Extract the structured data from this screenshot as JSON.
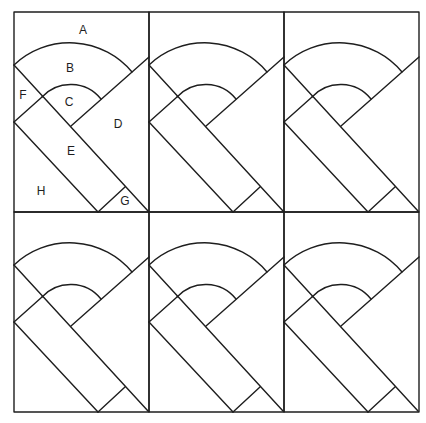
{
  "figure": {
    "type": "quilt-block-diagram",
    "grid": {
      "rows": 2,
      "cols": 3
    },
    "stroke_color": "#1e1e1e",
    "background": "#ffffff"
  },
  "labels": {
    "A": "A",
    "B": "B",
    "C": "C",
    "D": "D",
    "E": "E",
    "F": "F",
    "G": "G",
    "H": "H"
  },
  "piece_labels": [
    {
      "key": "A",
      "x": 83,
      "y": 30
    },
    {
      "key": "B",
      "x": 70,
      "y": 68
    },
    {
      "key": "C",
      "x": 69,
      "y": 102
    },
    {
      "key": "D",
      "x": 118,
      "y": 124
    },
    {
      "key": "E",
      "x": 71,
      "y": 151
    },
    {
      "key": "F",
      "x": 23,
      "y": 95
    },
    {
      "key": "G",
      "x": 125,
      "y": 201
    },
    {
      "key": "H",
      "x": 41,
      "y": 191
    }
  ]
}
